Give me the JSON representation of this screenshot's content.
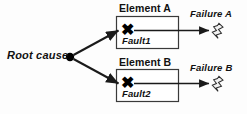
{
  "diagram": {
    "type": "fault-propagation-diagram",
    "background_color": "#fdfdfd",
    "line_color": "#1a1a1a",
    "box_fill": "#ffffff",
    "box_border": "#3a3a3a",
    "root": {
      "label": "Root cause",
      "node_icon": "filled-dot"
    },
    "elements": [
      {
        "title": "Element A",
        "fault_label": "Fault1",
        "fault_icon": "x-mark",
        "failure_label": "Failure A",
        "failure_icon": "lightning-bolt-icon"
      },
      {
        "title": "Element B",
        "fault_label": "Fault2",
        "fault_icon": "x-mark",
        "failure_label": "Failure B",
        "failure_icon": "lightning-bolt-icon"
      }
    ]
  }
}
